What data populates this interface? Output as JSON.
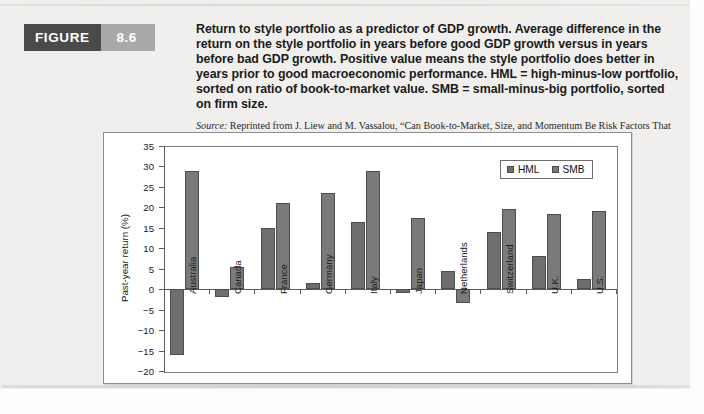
{
  "figure": {
    "badge_label": "FIGURE",
    "badge_number": "8.6",
    "caption": "Return to style portfolio as a predictor of GDP growth. Average difference in the return on the style portfolio in years before good GDP growth versus in years before bad GDP growth. Positive value means the style portfolio does better in years prior to good macroeconomic performance. HML = high-minus-low portfolio, sorted on ratio of book-to-market value. SMB = small-minus-big portfolio, sorted on firm size.",
    "source_prefix": "Source:",
    "source_text_1": " Reprinted from J. Liew and M. Vassalou, “Can Book-to-Market, Size, and Momentum Be Risk Factors That Predict Economic Growth?” ",
    "source_italic_journal": "Journal of Financial Economics",
    "source_text_2": " 57 (2000), pp. 221–245."
  },
  "colors": {
    "badge_dark": "#4a4a4a",
    "badge_light": "#a9a9a9",
    "bar_hml": "#6e6e6e",
    "bar_smb": "#7a7a7a",
    "axis": "#5c5c5c",
    "page_background": "#f0efed"
  },
  "chart_data": {
    "type": "bar",
    "title": "",
    "xlabel": "",
    "ylabel": "Past-year return (%)",
    "ylim": [
      -20,
      35
    ],
    "yticks": [
      35,
      30,
      25,
      20,
      15,
      10,
      5,
      0,
      -5,
      -10,
      -15,
      -20
    ],
    "ytick_labels": [
      "35",
      "30",
      "25",
      "20",
      "15",
      "10",
      "5",
      "0",
      "−5",
      "−10",
      "−15",
      "−20"
    ],
    "grid": false,
    "legend_position": "top-right",
    "categories": [
      "Australia",
      "Canada",
      "France",
      "Germany",
      "Italy",
      "Japan",
      "Netherlands",
      "Switzerland",
      "U.K.",
      "U.S."
    ],
    "series": [
      {
        "name": "HML",
        "color": "#6e6e6e",
        "values": [
          -16.0,
          -2.0,
          15.0,
          1.5,
          16.5,
          -1.0,
          4.5,
          14.0,
          8.0,
          2.5
        ]
      },
      {
        "name": "SMB",
        "color": "#7a7a7a",
        "values": [
          28.8,
          5.5,
          21.0,
          23.5,
          29.0,
          17.5,
          -3.5,
          19.5,
          18.5,
          19.0
        ]
      }
    ]
  }
}
